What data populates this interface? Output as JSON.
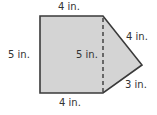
{
  "diagram": {
    "shape": "composite figure: rectangle plus triangle",
    "colors": {
      "fill": "#d4d4d4",
      "stroke": "#3a3a3a",
      "text": "#333333"
    },
    "labels": {
      "top": "4 in.",
      "left": "5 in.",
      "inner_dashed": "5 in.",
      "upper_slant": "4 in.",
      "lower_slant": "3 in.",
      "bottom": "4 in."
    }
  }
}
